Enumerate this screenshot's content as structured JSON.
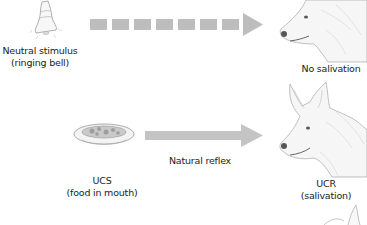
{
  "neutral_stimulus": {
    "icon": "bell-icon",
    "label_line1": "Neutral stimulus",
    "label_line2": "(ringing bell)"
  },
  "dashed_arrow": {
    "segments": 7,
    "color": "#bdbdbd"
  },
  "dog_top": {
    "icon": "dog-head-icon",
    "label": "No salivation"
  },
  "ucs": {
    "icon": "food-bowl-icon",
    "label_line1": "UCS",
    "label_line2": "(food in mouth)"
  },
  "solid_arrow": {
    "label": "Natural reflex",
    "color": "#c4c4c4"
  },
  "ucr": {
    "icon": "dog-head-icon",
    "label_line1": "UCR",
    "label_line2": "(salivation)"
  }
}
